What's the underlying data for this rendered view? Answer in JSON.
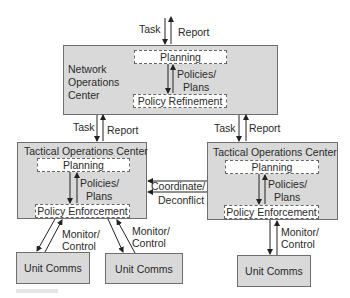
{
  "colors": {
    "box_fill": "#d9d9d9",
    "box_border": "#6e6e6e",
    "subbox_fill": "#ffffff",
    "arrow": "#222222"
  },
  "top_interface": {
    "task_label": "Task",
    "report_label": "Report"
  },
  "noc": {
    "title_lines": [
      "Network",
      "Operations",
      "Center"
    ],
    "planning_label": "Planning",
    "flow_label_lines": [
      "Policies/",
      "Plans"
    ],
    "refinement_label": "Policy Refinement"
  },
  "noc_to_toc_left": {
    "task_label": "Task",
    "report_label": "Report"
  },
  "noc_to_toc_right": {
    "task_label": "Task",
    "report_label": "Report"
  },
  "toc_left": {
    "title": "Tactical Operations Center",
    "planning_label": "Planning",
    "flow_label_lines": [
      "Policies/",
      "Plans"
    ],
    "enforcement_label": "Policy Enforcement"
  },
  "toc_right": {
    "title": "Tactical Operations Center",
    "planning_label": "Planning",
    "flow_label_lines": [
      "Policies/",
      "Plans"
    ],
    "enforcement_label": "Policy Enforcement"
  },
  "coordination": {
    "label_lines": [
      "Coordinate/",
      "Deconflict"
    ]
  },
  "monitor_links": [
    {
      "label_lines": [
        "Monitor/",
        "Control"
      ]
    },
    {
      "label_lines": [
        "Monitor/",
        "Control"
      ]
    },
    {
      "label_lines": [
        "Monitor/",
        "Control"
      ]
    }
  ],
  "unit_comms": [
    {
      "label": "Unit Comms"
    },
    {
      "label": "Unit Comms"
    },
    {
      "label": "Unit Comms"
    }
  ]
}
